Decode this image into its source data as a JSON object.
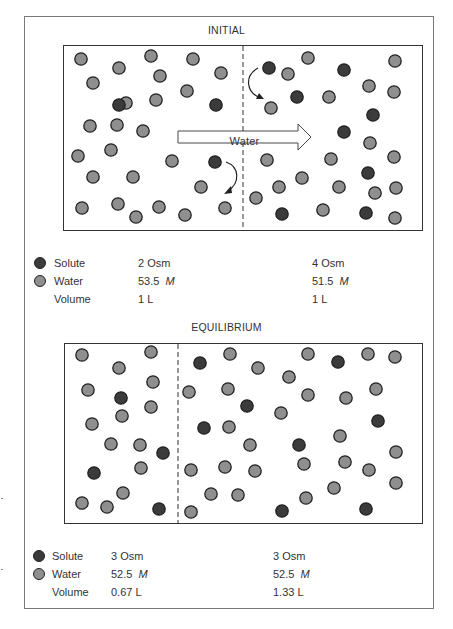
{
  "colors": {
    "solute": "#3b3b3b",
    "water": "#8f8f8f",
    "outline": "#222222",
    "frame": "#7a7a7a"
  },
  "initial": {
    "title": "INITIAL",
    "arrow_label": "Water",
    "legend": {
      "solute_label": "Solute",
      "water_label": "Water",
      "volume_label": "Volume",
      "left": {
        "solute": "2 Osm",
        "water_value": "53.5",
        "water_unit": "M",
        "volume": "1 L"
      },
      "right": {
        "solute": "4 Osm",
        "water_value": "51.5",
        "water_unit": "M",
        "volume": "1 L"
      }
    }
  },
  "equilibrium": {
    "title": "EQUILIBRIUM",
    "legend": {
      "solute_label": "Solute",
      "water_label": "Water",
      "volume_label": "Volume",
      "left": {
        "solute": "3 Osm",
        "water_value": "52.5",
        "water_unit": "M",
        "volume": "0.67 L"
      },
      "right": {
        "solute": "3 Osm",
        "water_value": "52.5",
        "water_unit": "M",
        "volume": "1.33 L"
      }
    }
  },
  "particles": {
    "initial": [
      [
        "w",
        81,
        59
      ],
      [
        "w",
        119,
        68
      ],
      [
        "w",
        151,
        56
      ],
      [
        "w",
        193,
        59
      ],
      [
        "w",
        221,
        73
      ],
      [
        "w",
        93,
        83
      ],
      [
        "w",
        160,
        76
      ],
      [
        "w",
        187,
        91
      ],
      [
        "w",
        126,
        103
      ],
      [
        "w",
        156,
        100
      ],
      [
        "s",
        119,
        105
      ],
      [
        "s",
        216,
        105
      ],
      [
        "w",
        90,
        126
      ],
      [
        "w",
        117,
        125
      ],
      [
        "w",
        143,
        131
      ],
      [
        "w",
        78,
        156
      ],
      [
        "w",
        111,
        150
      ],
      [
        "w",
        172,
        161
      ],
      [
        "s",
        215,
        162
      ],
      [
        "w",
        93,
        177
      ],
      [
        "w",
        133,
        177
      ],
      [
        "w",
        201,
        187
      ],
      [
        "w",
        82,
        208
      ],
      [
        "w",
        118,
        204
      ],
      [
        "w",
        136,
        217
      ],
      [
        "w",
        159,
        207
      ],
      [
        "w",
        185,
        215
      ],
      [
        "w",
        225,
        208
      ],
      [
        "s",
        269,
        68
      ],
      [
        "w",
        288,
        74
      ],
      [
        "w",
        308,
        58
      ],
      [
        "s",
        344,
        70
      ],
      [
        "w",
        395,
        61
      ],
      [
        "s",
        297,
        97
      ],
      [
        "w",
        271,
        108
      ],
      [
        "w",
        329,
        97
      ],
      [
        "w",
        369,
        86
      ],
      [
        "w",
        394,
        92
      ],
      [
        "s",
        373,
        115
      ],
      [
        "s",
        344,
        132
      ],
      [
        "w",
        370,
        143
      ],
      [
        "w",
        267,
        160
      ],
      [
        "w",
        331,
        159
      ],
      [
        "w",
        394,
        157
      ],
      [
        "s",
        368,
        173
      ],
      [
        "w",
        279,
        187
      ],
      [
        "w",
        302,
        178
      ],
      [
        "w",
        339,
        187
      ],
      [
        "w",
        375,
        193
      ],
      [
        "w",
        396,
        188
      ],
      [
        "w",
        256,
        198
      ],
      [
        "s",
        282,
        214
      ],
      [
        "w",
        323,
        210
      ],
      [
        "s",
        366,
        213
      ],
      [
        "w",
        395,
        218
      ]
    ],
    "equilibrium": [
      [
        "w",
        82,
        355
      ],
      [
        "w",
        151,
        352
      ],
      [
        "w",
        119,
        368
      ],
      [
        "w",
        153,
        382
      ],
      [
        "w",
        88,
        390
      ],
      [
        "s",
        121,
        398
      ],
      [
        "w",
        151,
        407
      ],
      [
        "w",
        122,
        416
      ],
      [
        "w",
        92,
        424
      ],
      [
        "w",
        140,
        445
      ],
      [
        "s",
        163,
        453
      ],
      [
        "w",
        111,
        444
      ],
      [
        "w",
        141,
        468
      ],
      [
        "s",
        94,
        473
      ],
      [
        "w",
        123,
        493
      ],
      [
        "w",
        82,
        503
      ],
      [
        "w",
        107,
        507
      ],
      [
        "s",
        159,
        509
      ],
      [
        "s",
        200,
        363
      ],
      [
        "w",
        230,
        354
      ],
      [
        "w",
        258,
        368
      ],
      [
        "w",
        308,
        354
      ],
      [
        "s",
        338,
        362
      ],
      [
        "w",
        368,
        354
      ],
      [
        "w",
        395,
        357
      ],
      [
        "w",
        289,
        377
      ],
      [
        "w",
        189,
        392
      ],
      [
        "w",
        228,
        389
      ],
      [
        "w",
        308,
        395
      ],
      [
        "w",
        346,
        398
      ],
      [
        "w",
        376,
        389
      ],
      [
        "s",
        247,
        406
      ],
      [
        "w",
        281,
        413
      ],
      [
        "s",
        378,
        421
      ],
      [
        "s",
        204,
        428
      ],
      [
        "w",
        229,
        427
      ],
      [
        "w",
        340,
        436
      ],
      [
        "w",
        250,
        445
      ],
      [
        "s",
        299,
        445
      ],
      [
        "w",
        396,
        452
      ],
      [
        "w",
        191,
        470
      ],
      [
        "w",
        225,
        467
      ],
      [
        "w",
        255,
        471
      ],
      [
        "w",
        304,
        464
      ],
      [
        "w",
        345,
        462
      ],
      [
        "w",
        369,
        470
      ],
      [
        "w",
        396,
        483
      ],
      [
        "w",
        211,
        494
      ],
      [
        "w",
        238,
        495
      ],
      [
        "w",
        334,
        488
      ],
      [
        "w",
        306,
        498
      ],
      [
        "s",
        282,
        511
      ],
      [
        "s",
        366,
        509
      ],
      [
        "w",
        191,
        512
      ]
    ]
  }
}
